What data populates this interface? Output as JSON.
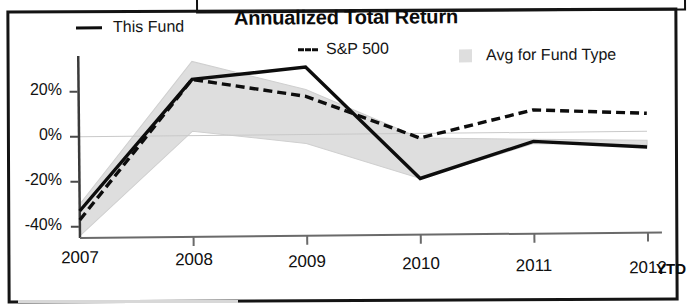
{
  "chart_data": {
    "type": "line",
    "title": "Annualized Total Return",
    "xlabel": "",
    "ylabel": "",
    "x": [
      "2007",
      "2008",
      "2009",
      "2010",
      "2011",
      "2012"
    ],
    "x_suffix": "YTD",
    "ylim": [
      -45,
      35
    ],
    "ytick_labels": [
      "20%",
      "0%",
      "-20%",
      "-40%"
    ],
    "ytick_values": [
      20,
      0,
      -20,
      -40
    ],
    "grid": false,
    "zero_line": true,
    "legend_position": "top",
    "series": [
      {
        "name": "This Fund",
        "style": "solid",
        "color": "#0d0d0d",
        "values": [
          -33,
          25,
          30,
          -20,
          -4,
          -7
        ]
      },
      {
        "name": "S&P 500",
        "style": "dashed",
        "color": "#0d0d0d",
        "values": [
          -37,
          25,
          17,
          -2,
          10,
          8
        ]
      },
      {
        "name": "Avg for Fund Type",
        "style": "band",
        "color": "#dedede",
        "upper": [
          -30,
          33,
          20,
          -2,
          -3,
          -4
        ],
        "lower": [
          -44,
          2,
          -4,
          -20,
          -5,
          -6
        ]
      }
    ]
  },
  "title": "Annualized Total Return",
  "legend": {
    "fund_label": "This Fund",
    "sp_label": "S&P 500",
    "avg_label": "Avg for Fund Type"
  },
  "axes": {
    "y_ticks": [
      "20%",
      "0%",
      "-20%",
      "-40%"
    ],
    "x_ticks": [
      "2007",
      "2008",
      "2009",
      "2010",
      "2011",
      "2012"
    ],
    "x_suffix": "YTD"
  }
}
